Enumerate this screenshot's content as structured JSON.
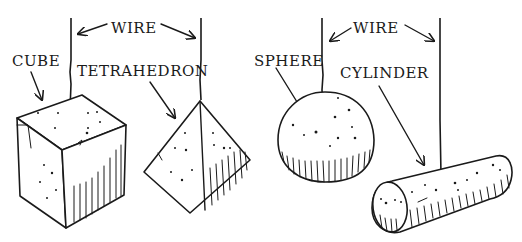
{
  "figure": {
    "labels": {
      "wire_left": "WIRE",
      "wire_right": "WIRE",
      "cube": "CUBE",
      "tetrahedron": "TETRAHEDRON",
      "sphere": "SPHERE",
      "cylinder": "CYLINDER"
    },
    "ink_color": "#1a1a1a",
    "background_color": "#ffffff"
  }
}
